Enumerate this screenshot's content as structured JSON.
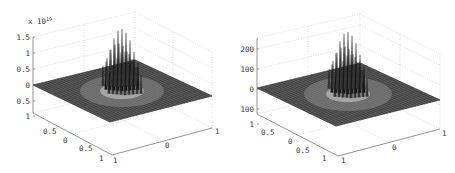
{
  "chart_data": [
    {
      "type": "surface",
      "title": "",
      "xlabel": "",
      "ylabel": "",
      "zlabel": "",
      "z_exponent_label": "x 10",
      "z_exponent": "19",
      "z_ticks": [
        "0",
        "0.5",
        "1",
        "1.5"
      ],
      "z_range": [
        -0.5,
        1.5
      ],
      "z_lower_tick_labels": [
        "0.5",
        "1"
      ],
      "y_ticks": [
        "1",
        "0.5",
        "0",
        "0.5",
        "1"
      ],
      "x_ticks": [
        "1",
        "0",
        "1"
      ],
      "grid": true,
      "description": "Flat mesh plane at z=0 over [-1,1]x[-1,1] with a cluster of tall spikes near the center reaching ~1.5e19"
    },
    {
      "type": "surface",
      "title": "",
      "xlabel": "",
      "ylabel": "",
      "zlabel": "",
      "z_ticks": [
        "200",
        "100",
        "0"
      ],
      "z_lower_tick_labels": [
        "100",
        "1"
      ],
      "z_range": [
        -100,
        230
      ],
      "y_ticks": [
        "1",
        "0.5",
        "0",
        "0.5",
        "1"
      ],
      "x_ticks": [
        "1",
        "0",
        "1"
      ],
      "grid": true,
      "description": "Flat mesh plane at z=0 over [-1,1]x[-1,1] with a cluster of spikes near the center reaching ~200"
    }
  ],
  "plots": [
    {
      "exp_base": "x 10",
      "exp_power": "19",
      "z_labels": [
        {
          "text": "1.5",
          "y": 37
        },
        {
          "text": "1",
          "y": 53
        },
        {
          "text": "0.5",
          "y": 69
        },
        {
          "text": "0",
          "y": 85
        },
        {
          "text": "0.5",
          "y": 101
        },
        {
          "text": "1",
          "y": 116
        }
      ],
      "y_labels": [
        {
          "text": "0.5",
          "x": 43,
          "y": 134
        },
        {
          "text": "0",
          "x": 63,
          "y": 143
        },
        {
          "text": "0.5",
          "x": 79,
          "y": 151
        },
        {
          "text": "1",
          "x": 99,
          "y": 161
        }
      ],
      "x_labels": [
        {
          "text": "1",
          "x": 113,
          "y": 163
        },
        {
          "text": "0",
          "x": 165,
          "y": 148
        },
        {
          "text": "1",
          "x": 215,
          "y": 134
        }
      ]
    },
    {
      "z_labels": [
        {
          "text": "200",
          "y": 49
        },
        {
          "text": "100",
          "y": 69
        },
        {
          "text": "0",
          "y": 89
        },
        {
          "text": "100",
          "y": 109
        },
        {
          "text": "1",
          "y": 124
        }
      ],
      "y_labels": [
        {
          "text": "0.5",
          "x": 261,
          "y": 135
        },
        {
          "text": "0",
          "x": 288,
          "y": 144
        },
        {
          "text": "0.5",
          "x": 296,
          "y": 153
        },
        {
          "text": "1",
          "x": 322,
          "y": 161
        }
      ],
      "x_labels": [
        {
          "text": "1",
          "x": 341,
          "y": 163
        },
        {
          "text": "0",
          "x": 392,
          "y": 150
        },
        {
          "text": "1",
          "x": 442,
          "y": 136
        }
      ]
    }
  ]
}
